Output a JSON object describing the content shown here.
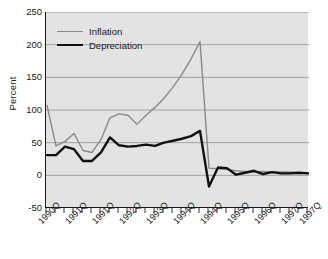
{
  "chart_data": {
    "type": "line",
    "title": "",
    "xlabel": "",
    "ylabel": "Percent",
    "ylim": [
      -50,
      250
    ],
    "yticks": [
      -50,
      0,
      50,
      100,
      150,
      200,
      250
    ],
    "ytick_labels": [
      "-50",
      "0",
      "50",
      "100",
      "150",
      "200",
      "250"
    ],
    "grid": "horizontal",
    "legend_position": "top-left",
    "x": [
      "1990Q1",
      "1990Q2",
      "1990Q3",
      "1990Q4",
      "1991Q1",
      "1991Q2",
      "1991Q3",
      "1991Q4",
      "1992Q1",
      "1992Q2",
      "1992Q3",
      "1992Q4",
      "1993Q1",
      "1993Q2",
      "1993Q3",
      "1993Q4",
      "1994Q1",
      "1994Q2",
      "1994Q3",
      "1994Q4",
      "1995Q1",
      "1995Q2",
      "1995Q3",
      "1995Q4",
      "1996Q1",
      "1996Q2",
      "1996Q3",
      "1996Q4",
      "1997Q1",
      "1997Q2"
    ],
    "xtick_labels": [
      "1990Q",
      "1991Q",
      "1991Q",
      "1992Q",
      "1993Q",
      "1994Q",
      "1994Q",
      "1995Q",
      "1996Q",
      "1997Q",
      "1997Q"
    ],
    "xtick_label_indices": [
      0,
      3,
      6,
      9,
      12,
      15,
      18,
      21,
      24,
      27,
      29
    ],
    "series": [
      {
        "name": "Inflation",
        "color": "#8a8a8a",
        "width": 1.4,
        "values": [
          107,
          45,
          52,
          64,
          38,
          35,
          55,
          88,
          94,
          92,
          78,
          92,
          104,
          118,
          135,
          155,
          178,
          205,
          11,
          10,
          9,
          7,
          6,
          5,
          6,
          5,
          5,
          5,
          4,
          4
        ]
      },
      {
        "name": "Depreciation",
        "color": "#111111",
        "width": 2.4,
        "values": [
          31,
          31,
          44,
          40,
          22,
          22,
          35,
          58,
          46,
          44,
          45,
          47,
          45,
          50,
          53,
          56,
          60,
          68,
          -17,
          12,
          11,
          1,
          4,
          7,
          2,
          5,
          3,
          3,
          4,
          3
        ]
      }
    ]
  },
  "legend": {
    "items": [
      {
        "label": "Inflation",
        "key": "inflation"
      },
      {
        "label": "Depreciation",
        "key": "depreciation"
      }
    ]
  },
  "colors": {
    "plot_background": "#e3e3e3",
    "gridline": "#9a9a9a",
    "axis": "#1a1a1a",
    "inflation": "#8a8a8a",
    "depreciation": "#111111",
    "page_background": "#ffffff"
  }
}
